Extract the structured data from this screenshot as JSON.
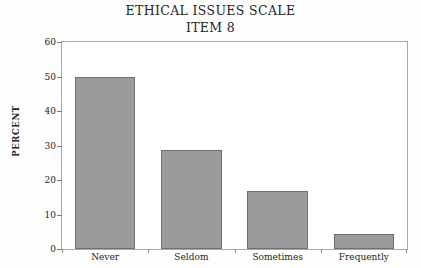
{
  "chart_data": {
    "type": "bar",
    "title": "ETHICAL ISSUES SCALE",
    "subtitle": "ITEM 8",
    "xlabel": "",
    "ylabel": "PERCENT",
    "categories": [
      "Never",
      "Seldom",
      "Sometimes",
      "Frequently"
    ],
    "values": [
      50.0,
      28.7,
      16.8,
      4.3
    ],
    "ylim": [
      0,
      60
    ],
    "yticks": [
      0,
      10,
      20,
      30,
      40,
      50,
      60
    ],
    "ytick_labels": [
      "0",
      "10",
      "20",
      "30",
      "40",
      "50",
      "60"
    ],
    "grid": false,
    "legend": null,
    "bar_color": "#9b9b9b",
    "bar_edge_color": "#707070",
    "axes_color": "#a9a9a9",
    "background": "#ffffff",
    "series": [
      {
        "name": "Percent",
        "values": [
          50.0,
          28.7,
          16.8,
          4.3
        ]
      }
    ]
  }
}
